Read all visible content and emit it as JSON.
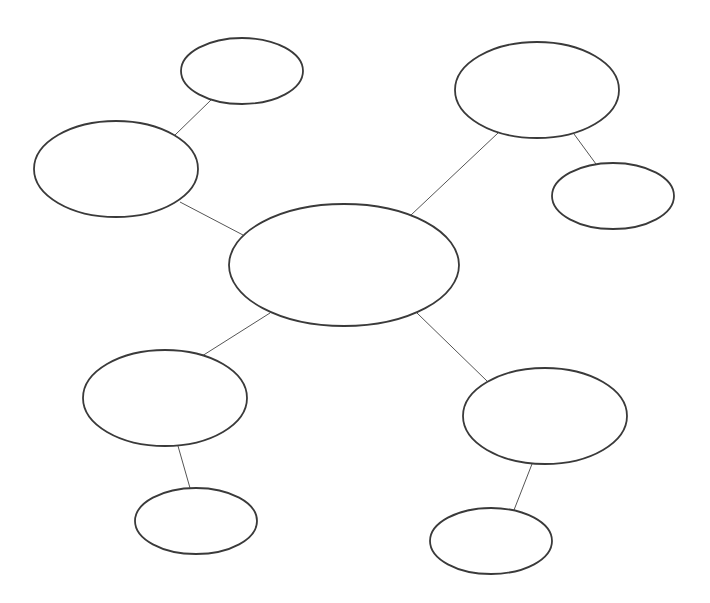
{
  "diagram": {
    "type": "cluster-map",
    "background": "#ffffff",
    "stroke_color": "#3a3a3a",
    "edge_color": "#555555",
    "nodes": [
      {
        "id": "center",
        "label": "",
        "cx": 344,
        "cy": 265,
        "rx": 115,
        "ry": 61
      },
      {
        "id": "left",
        "label": "",
        "cx": 116,
        "cy": 169,
        "rx": 82,
        "ry": 48
      },
      {
        "id": "top-left",
        "label": "",
        "cx": 242,
        "cy": 71,
        "rx": 61,
        "ry": 33
      },
      {
        "id": "top-right",
        "label": "",
        "cx": 537,
        "cy": 90,
        "rx": 82,
        "ry": 48
      },
      {
        "id": "right",
        "label": "",
        "cx": 613,
        "cy": 196,
        "rx": 61,
        "ry": 33
      },
      {
        "id": "bottom-left",
        "label": "",
        "cx": 165,
        "cy": 398,
        "rx": 82,
        "ry": 48
      },
      {
        "id": "bottom-left-child",
        "label": "",
        "cx": 196,
        "cy": 521,
        "rx": 61,
        "ry": 33
      },
      {
        "id": "bottom-right",
        "label": "",
        "cx": 545,
        "cy": 416,
        "rx": 82,
        "ry": 48
      },
      {
        "id": "bottom-right-child",
        "label": "",
        "cx": 491,
        "cy": 541,
        "rx": 61,
        "ry": 33
      }
    ],
    "edges": [
      {
        "from": "center",
        "to": "left",
        "x1": 243,
        "y1": 235,
        "x2": 180,
        "y2": 202
      },
      {
        "from": "left",
        "to": "top-left",
        "x1": 175,
        "y1": 135,
        "x2": 211,
        "y2": 100
      },
      {
        "from": "center",
        "to": "top-right",
        "x1": 411,
        "y1": 215,
        "x2": 498,
        "y2": 133
      },
      {
        "from": "top-right",
        "to": "right",
        "x1": 574,
        "y1": 134,
        "x2": 596,
        "y2": 164
      },
      {
        "from": "center",
        "to": "bottom-left",
        "x1": 270,
        "y1": 313,
        "x2": 202,
        "y2": 356
      },
      {
        "from": "bottom-left",
        "to": "bottom-left-child",
        "x1": 178,
        "y1": 446,
        "x2": 190,
        "y2": 488
      },
      {
        "from": "center",
        "to": "bottom-right",
        "x1": 417,
        "y1": 313,
        "x2": 487,
        "y2": 381
      },
      {
        "from": "bottom-right",
        "to": "bottom-right-child",
        "x1": 532,
        "y1": 464,
        "x2": 514,
        "y2": 510
      }
    ]
  }
}
